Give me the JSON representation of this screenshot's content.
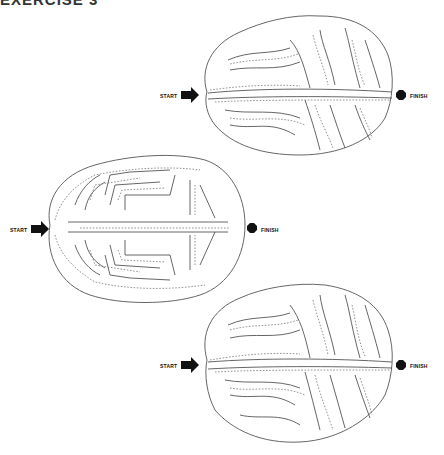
{
  "page": {
    "title": "EXERCISE 3"
  },
  "mazes": [
    {
      "name": "top-brain-maze",
      "start_label": "START",
      "finish_label": "FINISH"
    },
    {
      "name": "middle-brain-maze",
      "start_label": "START",
      "finish_label": "FINISH"
    },
    {
      "name": "bottom-brain-maze",
      "start_label": "START",
      "finish_label": "FINISH"
    }
  ],
  "colors": {
    "line": "#555555",
    "marker": "#111111",
    "background": "#ffffff"
  }
}
